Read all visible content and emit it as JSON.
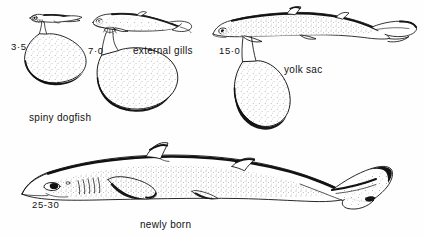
{
  "figure": {
    "subject": "spiny dogfish",
    "background_color": "#fefefe",
    "ink_color": "#111111"
  },
  "labels": {
    "stage1_size": "3·5",
    "stage2_size": "7·0",
    "stage3_size": "15·0",
    "stage4_size": "25-30",
    "species_name": "spiny dogfish",
    "external_gills": "external gills",
    "yolk_sac": "yolk sac",
    "newly_born": "newly born"
  },
  "stages": [
    {
      "id": "stage-1",
      "size": "3·5",
      "caption": "spiny dogfish",
      "has_yolk_sac": true,
      "has_external_gills": true,
      "description": "earliest embryo with large pear-shaped yolk sac"
    },
    {
      "id": "stage-2",
      "size": "7·0",
      "caption": "external gills",
      "has_yolk_sac": true,
      "has_external_gills": true,
      "description": "embryo with filamentous external gills and yolk sac"
    },
    {
      "id": "stage-3",
      "size": "15·0",
      "caption": "yolk sac",
      "has_yolk_sac": true,
      "has_external_gills": false,
      "description": "advanced embryo with reduced yolk sac"
    },
    {
      "id": "stage-4",
      "size": "25-30",
      "caption": "newly born",
      "has_yolk_sac": false,
      "has_external_gills": false,
      "description": "fully formed newly born pup"
    }
  ]
}
